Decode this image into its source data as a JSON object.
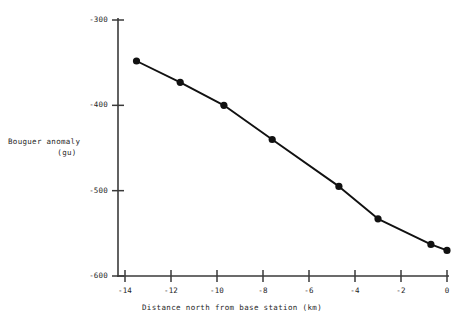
{
  "chart_data": {
    "type": "line",
    "title": "",
    "xlabel": "Distance north from base station (km)",
    "ylabel": "Bouguer anomaly",
    "ylabel_units": "(gu)",
    "xlim": [
      -14.6,
      0.2
    ],
    "ylim": [
      -600,
      -300
    ],
    "xticks": [
      -14,
      -12,
      -10,
      -8,
      -6,
      -4,
      -2,
      0
    ],
    "xtick_labels": [
      "-14",
      "-12",
      "-10",
      "-8",
      "-6",
      "-4",
      "-2",
      "0"
    ],
    "yticks": [
      -300,
      -400,
      -500,
      -600
    ],
    "ytick_labels": [
      "-300",
      "-400",
      "-500",
      "-600"
    ],
    "grid": false,
    "legend": "none",
    "marker": "filled-circle",
    "line_color": "#111111",
    "marker_color": "#111111",
    "x": [
      -13.5,
      -11.6,
      -9.7,
      -7.6,
      -4.7,
      -3.0,
      -0.7,
      0.0
    ],
    "values": [
      -348,
      -373,
      -400,
      -440,
      -495,
      -533,
      -563,
      -570
    ],
    "series": [
      {
        "name": "Bouguer anomaly profile",
        "points": [
          {
            "x": -13.5,
            "y": -348
          },
          {
            "x": -11.6,
            "y": -373
          },
          {
            "x": -9.7,
            "y": -400
          },
          {
            "x": -7.6,
            "y": -440
          },
          {
            "x": -4.7,
            "y": -495
          },
          {
            "x": -3.0,
            "y": -533
          },
          {
            "x": -0.7,
            "y": -563
          },
          {
            "x": 0.0,
            "y": -570
          }
        ]
      }
    ]
  },
  "axis_labels": {
    "y_line1": "Bouguer anomaly",
    "y_line2": "(gu)",
    "x": "Distance north from base station (km)"
  }
}
